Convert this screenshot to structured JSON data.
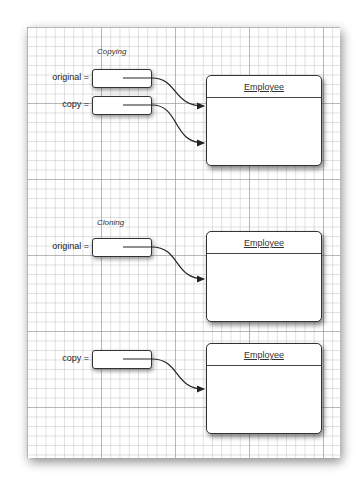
{
  "sections": {
    "copying": {
      "title": "Copying",
      "variables": [
        {
          "label": "original ="
        },
        {
          "label": "copy ="
        }
      ],
      "object": {
        "class_name": "Employee"
      }
    },
    "cloning": {
      "title": "Cloning",
      "original": {
        "label": "original =",
        "object": {
          "class_name": "Employee"
        }
      },
      "copy": {
        "label": "copy =",
        "object": {
          "class_name": "Employee"
        }
      }
    }
  },
  "colors": {
    "line": "#333333",
    "grid": "#b9b9b9",
    "background": "#ffffff"
  }
}
